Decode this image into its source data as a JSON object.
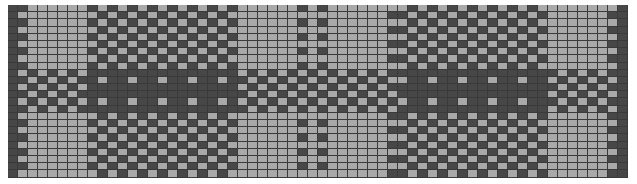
{
  "grid": {
    "columns": 62,
    "rows": 24,
    "cell_width_px": 10,
    "cell_height_px": 7.2,
    "colors": {
      "light": "#a9a9a9",
      "dark": "#474747",
      "line": "#3a3a3a",
      "background": "#ffffff"
    }
  },
  "column_blocks": [
    {
      "type": "border",
      "from": 0,
      "to": 0
    },
    {
      "type": "edge",
      "from": 1,
      "to": 1
    },
    {
      "type": "A",
      "from": 2,
      "to": 7
    },
    {
      "type": "B",
      "from": 8,
      "to": 22
    },
    {
      "type": "A",
      "from": 23,
      "to": 28
    },
    {
      "type": "edge",
      "from": 29,
      "to": 29
    },
    {
      "type": "A",
      "from": 30,
      "to": 30
    },
    {
      "type": "edge",
      "from": 31,
      "to": 31
    },
    {
      "type": "A",
      "from": 32,
      "to": 37
    },
    {
      "type": "edge",
      "from": 38,
      "to": 38
    },
    {
      "type": "B",
      "from": 39,
      "to": 53
    },
    {
      "type": "A",
      "from": 54,
      "to": 59
    },
    {
      "type": "edge",
      "from": 60,
      "to": 60
    },
    {
      "type": "border",
      "from": 61,
      "to": 61
    }
  ],
  "row_blocks": [
    {
      "type": "A",
      "from": 0,
      "to": 8
    },
    {
      "type": "B",
      "from": 9,
      "to": 14
    },
    {
      "type": "A",
      "from": 15,
      "to": 23
    }
  ],
  "tie_rows": [
    9,
    12
  ]
}
